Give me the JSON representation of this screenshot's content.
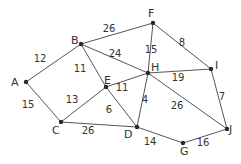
{
  "diagram": {
    "type": "weighted-undirected-graph",
    "nodes": [
      {
        "id": "A",
        "x": 26,
        "y": 82,
        "lx": 11,
        "ly": 86
      },
      {
        "id": "B",
        "x": 81,
        "y": 44,
        "lx": 71,
        "ly": 44
      },
      {
        "id": "C",
        "x": 61,
        "y": 122,
        "lx": 52,
        "ly": 134
      },
      {
        "id": "D",
        "x": 137,
        "y": 127,
        "lx": 124,
        "ly": 138
      },
      {
        "id": "E",
        "x": 106,
        "y": 87,
        "lx": 104,
        "ly": 84
      },
      {
        "id": "F",
        "x": 153,
        "y": 23,
        "lx": 148,
        "ly": 17
      },
      {
        "id": "G",
        "x": 183,
        "y": 143,
        "lx": 180,
        "ly": 155
      },
      {
        "id": "H",
        "x": 148,
        "y": 73,
        "lx": 151,
        "ly": 71
      },
      {
        "id": "I",
        "x": 211,
        "y": 69,
        "lx": 215,
        "ly": 69
      },
      {
        "id": "J",
        "x": 227,
        "y": 129,
        "lx": 229,
        "ly": 133
      }
    ],
    "edges": [
      {
        "from": "A",
        "to": "B",
        "weight": "12",
        "lx": 40,
        "ly": 62
      },
      {
        "from": "A",
        "to": "C",
        "weight": "15",
        "lx": 28,
        "ly": 108
      },
      {
        "from": "B",
        "to": "F",
        "weight": "26",
        "lx": 109,
        "ly": 32
      },
      {
        "from": "B",
        "to": "H",
        "weight": "24",
        "lx": 115,
        "ly": 57
      },
      {
        "from": "B",
        "to": "E",
        "weight": "11",
        "lx": 80,
        "ly": 72
      },
      {
        "from": "C",
        "to": "E",
        "weight": "13",
        "lx": 72,
        "ly": 103
      },
      {
        "from": "C",
        "to": "D",
        "weight": "26",
        "lx": 88,
        "ly": 134
      },
      {
        "from": "E",
        "to": "H",
        "weight": "11",
        "lx": 122,
        "ly": 91
      },
      {
        "from": "E",
        "to": "D",
        "weight": "6",
        "lx": 109,
        "ly": 113
      },
      {
        "from": "F",
        "to": "H",
        "weight": "15",
        "lx": 151,
        "ly": 53
      },
      {
        "from": "F",
        "to": "I",
        "weight": "8",
        "lx": 182,
        "ly": 46
      },
      {
        "from": "H",
        "to": "I",
        "weight": "19",
        "lx": 178,
        "ly": 81
      },
      {
        "from": "H",
        "to": "D",
        "weight": "4",
        "lx": 145,
        "ly": 103
      },
      {
        "from": "H",
        "to": "J",
        "weight": "26",
        "lx": 177,
        "ly": 109
      },
      {
        "from": "I",
        "to": "J",
        "weight": "7",
        "lx": 222,
        "ly": 100
      },
      {
        "from": "D",
        "to": "G",
        "weight": "14",
        "lx": 150,
        "ly": 145
      },
      {
        "from": "G",
        "to": "J",
        "weight": "16",
        "lx": 203,
        "ly": 146
      }
    ]
  }
}
